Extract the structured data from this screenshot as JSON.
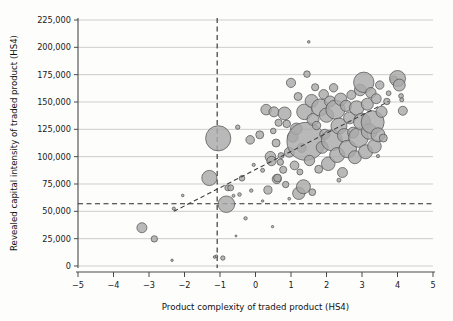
{
  "chart_data": {
    "type": "scatter",
    "title": "",
    "subtitle": "",
    "xlabel": "Product complexity of traded product (HS4)",
    "ylabel": "Revealed capital intensity of traded product (HS4)",
    "xlim": [
      -5,
      5
    ],
    "ylim": [
      0,
      225000
    ],
    "xticks": [
      -5,
      -4,
      -3,
      -2,
      -1,
      0,
      1,
      2,
      3,
      4,
      5
    ],
    "xticklabels": [
      "−5",
      "−4",
      "−3",
      "−2",
      "−1",
      "0",
      "1",
      "2",
      "3",
      "4",
      "5"
    ],
    "yticks": [
      0,
      25000,
      50000,
      75000,
      100000,
      125000,
      150000,
      175000,
      200000,
      225000
    ],
    "yticklabels": [
      "0",
      "25,000",
      "50,000",
      "75,000",
      "100,000",
      "125,000",
      "150,000",
      "175,000",
      "200,000",
      "225,000"
    ],
    "grid": "horizontal",
    "legend": "none",
    "marker": "bubble",
    "bubble_fill": "#a9a9a9",
    "bubble_stroke": "#4d4d4d",
    "reference_lines": [
      {
        "name": "vertical-mean-complexity",
        "orientation": "vertical",
        "x": -1.08,
        "style": "dashed"
      },
      {
        "name": "horizontal-mean-capital-intensity",
        "orientation": "horizontal",
        "y": 57000,
        "style": "dashed"
      }
    ],
    "trendline": {
      "style": "dashed",
      "x0": -2.3,
      "y0": 50000,
      "x1": 3.75,
      "y1": 150500
    },
    "points": [
      {
        "x": -3.2,
        "y": 35000,
        "s": 5.0
      },
      {
        "x": -2.85,
        "y": 24800,
        "s": 3.2
      },
      {
        "x": -2.35,
        "y": 5200,
        "s": 1.2
      },
      {
        "x": -2.3,
        "y": 52500,
        "s": 1.6
      },
      {
        "x": -2.05,
        "y": 64500,
        "s": 1.3
      },
      {
        "x": -1.3,
        "y": 80500,
        "s": 7.6
      },
      {
        "x": -1.15,
        "y": 8200,
        "s": 1.4
      },
      {
        "x": -1.1,
        "y": 9000,
        "s": 1.3
      },
      {
        "x": -1.05,
        "y": 116800,
        "s": 12.6
      },
      {
        "x": -0.92,
        "y": 7300,
        "s": 2.2
      },
      {
        "x": -0.82,
        "y": 56500,
        "s": 8.3
      },
      {
        "x": -0.78,
        "y": 71500,
        "s": 3.0
      },
      {
        "x": -0.7,
        "y": 71500,
        "s": 3.0
      },
      {
        "x": -0.62,
        "y": 64200,
        "s": 1.5
      },
      {
        "x": -0.5,
        "y": 127000,
        "s": 2.2
      },
      {
        "x": -0.45,
        "y": 65400,
        "s": 1.8
      },
      {
        "x": -0.38,
        "y": 80200,
        "s": 2.8
      },
      {
        "x": -0.28,
        "y": 43600,
        "s": 1.7
      },
      {
        "x": -0.15,
        "y": 115400,
        "s": 4.3
      },
      {
        "x": -0.12,
        "y": 69000,
        "s": 1.7
      },
      {
        "x": -0.05,
        "y": 92500,
        "s": 1.6
      },
      {
        "x": 0.12,
        "y": 120000,
        "s": 4.0
      },
      {
        "x": 0.2,
        "y": 87500,
        "s": 2.0
      },
      {
        "x": 0.3,
        "y": 143000,
        "s": 5.3
      },
      {
        "x": 0.35,
        "y": 69500,
        "s": 4.1
      },
      {
        "x": 0.42,
        "y": 100000,
        "s": 5.3
      },
      {
        "x": 0.45,
        "y": 96000,
        "s": 4.7
      },
      {
        "x": 0.48,
        "y": 36000,
        "s": 1.2
      },
      {
        "x": 0.5,
        "y": 123500,
        "s": 2.8
      },
      {
        "x": 0.52,
        "y": 141000,
        "s": 5.0
      },
      {
        "x": 0.58,
        "y": 112500,
        "s": 4.0
      },
      {
        "x": 0.6,
        "y": 79500,
        "s": 4.6
      },
      {
        "x": 0.62,
        "y": 80500,
        "s": 3.9
      },
      {
        "x": 0.65,
        "y": 131000,
        "s": 3.6
      },
      {
        "x": 0.7,
        "y": 95000,
        "s": 3.2
      },
      {
        "x": 0.72,
        "y": 101000,
        "s": 3.0
      },
      {
        "x": 0.78,
        "y": 88000,
        "s": 3.6
      },
      {
        "x": 0.82,
        "y": 139500,
        "s": 6.5
      },
      {
        "x": 0.85,
        "y": 74500,
        "s": 3.2
      },
      {
        "x": 0.88,
        "y": 130000,
        "s": 3.8
      },
      {
        "x": 0.95,
        "y": 104000,
        "s": 4.9
      },
      {
        "x": 1.0,
        "y": 167500,
        "s": 4.6
      },
      {
        "x": 1.05,
        "y": 118000,
        "s": 5.3
      },
      {
        "x": 1.1,
        "y": 92000,
        "s": 4.4
      },
      {
        "x": 1.15,
        "y": 125500,
        "s": 5.8
      },
      {
        "x": 1.2,
        "y": 155000,
        "s": 4.0
      },
      {
        "x": 1.22,
        "y": 66500,
        "s": 6.2
      },
      {
        "x": 1.25,
        "y": 86000,
        "s": 3.0
      },
      {
        "x": 1.3,
        "y": 108000,
        "s": 4.5
      },
      {
        "x": 1.35,
        "y": 72500,
        "s": 7.0
      },
      {
        "x": 1.38,
        "y": 141000,
        "s": 7.8
      },
      {
        "x": 1.42,
        "y": 114000,
        "s": 19.0
      },
      {
        "x": 1.45,
        "y": 175500,
        "s": 3.3
      },
      {
        "x": 1.5,
        "y": 205000,
        "s": 1.3
      },
      {
        "x": 1.52,
        "y": 96500,
        "s": 5.2
      },
      {
        "x": 1.58,
        "y": 151000,
        "s": 6.5
      },
      {
        "x": 1.62,
        "y": 134000,
        "s": 6.0
      },
      {
        "x": 1.68,
        "y": 163500,
        "s": 3.6
      },
      {
        "x": 1.72,
        "y": 128500,
        "s": 4.2
      },
      {
        "x": 1.78,
        "y": 88500,
        "s": 4.0
      },
      {
        "x": 1.82,
        "y": 145000,
        "s": 8.5
      },
      {
        "x": 1.88,
        "y": 108500,
        "s": 6.0
      },
      {
        "x": 1.92,
        "y": 157000,
        "s": 4.8
      },
      {
        "x": 1.95,
        "y": 120500,
        "s": 5.0
      },
      {
        "x": 2.0,
        "y": 138000,
        "s": 7.2
      },
      {
        "x": 2.05,
        "y": 93500,
        "s": 6.8
      },
      {
        "x": 2.1,
        "y": 150500,
        "s": 5.5
      },
      {
        "x": 2.15,
        "y": 115000,
        "s": 10.5
      },
      {
        "x": 2.2,
        "y": 163000,
        "s": 4.2
      },
      {
        "x": 2.25,
        "y": 143000,
        "s": 9.5
      },
      {
        "x": 2.3,
        "y": 101500,
        "s": 7.5
      },
      {
        "x": 2.35,
        "y": 128000,
        "s": 8.0
      },
      {
        "x": 2.4,
        "y": 152500,
        "s": 6.2
      },
      {
        "x": 2.45,
        "y": 85500,
        "s": 5.0
      },
      {
        "x": 2.5,
        "y": 119500,
        "s": 6.8
      },
      {
        "x": 2.55,
        "y": 146500,
        "s": 5.6
      },
      {
        "x": 2.6,
        "y": 107000,
        "s": 8.8
      },
      {
        "x": 2.65,
        "y": 135500,
        "s": 6.0
      },
      {
        "x": 2.7,
        "y": 156500,
        "s": 4.5
      },
      {
        "x": 2.75,
        "y": 122000,
        "s": 5.5
      },
      {
        "x": 2.8,
        "y": 99500,
        "s": 6.5
      },
      {
        "x": 2.85,
        "y": 144500,
        "s": 7.2
      },
      {
        "x": 2.9,
        "y": 117500,
        "s": 9.8
      },
      {
        "x": 2.95,
        "y": 161000,
        "s": 5.8
      },
      {
        "x": 3.0,
        "y": 132000,
        "s": 8.5
      },
      {
        "x": 3.05,
        "y": 168000,
        "s": 10.2
      },
      {
        "x": 3.1,
        "y": 104500,
        "s": 7.0
      },
      {
        "x": 3.15,
        "y": 148000,
        "s": 6.0
      },
      {
        "x": 3.2,
        "y": 123000,
        "s": 7.8
      },
      {
        "x": 3.25,
        "y": 158500,
        "s": 5.2
      },
      {
        "x": 3.3,
        "y": 131500,
        "s": 11.5
      },
      {
        "x": 3.35,
        "y": 109500,
        "s": 6.8
      },
      {
        "x": 3.4,
        "y": 153000,
        "s": 5.0
      },
      {
        "x": 3.45,
        "y": 120000,
        "s": 7.0
      },
      {
        "x": 3.5,
        "y": 165500,
        "s": 4.2
      },
      {
        "x": 3.55,
        "y": 141000,
        "s": 5.6
      },
      {
        "x": 3.6,
        "y": 117000,
        "s": 4.0
      },
      {
        "x": 3.7,
        "y": 150500,
        "s": 3.2
      },
      {
        "x": 3.75,
        "y": 158000,
        "s": 2.4
      },
      {
        "x": 3.9,
        "y": 170500,
        "s": 3.5
      },
      {
        "x": 4.0,
        "y": 171500,
        "s": 8.0
      },
      {
        "x": 4.05,
        "y": 165500,
        "s": 6.0
      },
      {
        "x": 4.1,
        "y": 155500,
        "s": 2.4
      },
      {
        "x": 4.12,
        "y": 152000,
        "s": 2.0
      },
      {
        "x": 4.15,
        "y": 142000,
        "s": 4.5
      },
      {
        "x": 3.45,
        "y": 100500,
        "s": 1.6
      },
      {
        "x": 2.35,
        "y": 78500,
        "s": 2.0
      },
      {
        "x": 1.6,
        "y": 67500,
        "s": 3.4
      },
      {
        "x": 0.95,
        "y": 61500,
        "s": 1.4
      },
      {
        "x": 0.2,
        "y": 59500,
        "s": 1.2
      },
      {
        "x": -0.55,
        "y": 27500,
        "s": 1.0
      }
    ]
  }
}
